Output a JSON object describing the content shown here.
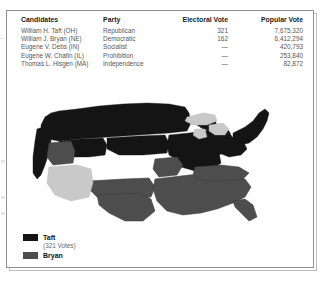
{
  "document": {
    "kind": "scanned-textbook-page",
    "border_color": "#8e8e8e"
  },
  "results_table": {
    "headers": {
      "candidates": "Candidates",
      "party": "Party",
      "electoral_vote": "Electoral Vote",
      "popular_vote": "Popular Vote"
    },
    "rows": [
      {
        "candidate": "William H. Taft (OH)",
        "party": "Republican",
        "electoral_vote": "321",
        "popular_vote": "7,675,320"
      },
      {
        "candidate": "William J. Bryan (NE)",
        "party": "Democratic",
        "electoral_vote": "162",
        "popular_vote": "6,412,294"
      },
      {
        "candidate": "Eugene V. Debs (IN)",
        "party": "Socialist",
        "electoral_vote": "—",
        "popular_vote": "420,793"
      },
      {
        "candidate": "Eugene W. Chafin (IL)",
        "party": "Prohibition",
        "electoral_vote": "—",
        "popular_vote": "253,840"
      },
      {
        "candidate": "Thomas L. Hisgen (MA)",
        "party": "Independence",
        "electoral_vote": "—",
        "popular_vote": "82,872"
      }
    ]
  },
  "legend": {
    "taft": {
      "label": "Taft",
      "votes": "(321 Votes)",
      "color": "#141414"
    },
    "bryan": {
      "label": "Bryan",
      "votes": "",
      "color": "#4d4d4d"
    },
    "territory_color": "#cccccc"
  },
  "map": {
    "name": "united-states-electoral-map-1908",
    "taft_color": "#141414",
    "bryan_color": "#4d4d4d",
    "territory_color": "#c9c9c9",
    "outline_color": "#2a2a2a"
  }
}
